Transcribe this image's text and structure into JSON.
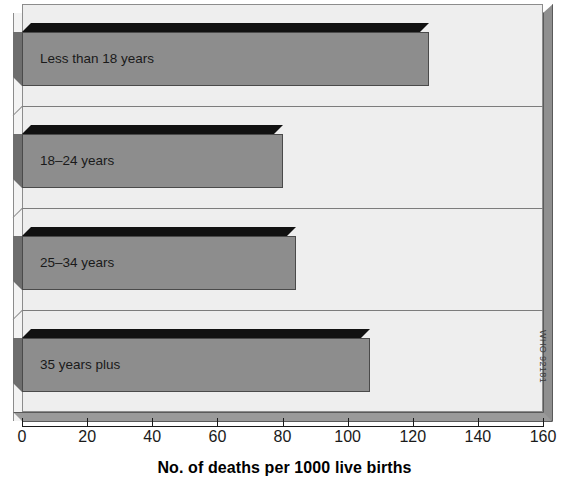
{
  "chart_data": {
    "type": "bar",
    "orientation": "horizontal",
    "title": "",
    "xlabel": "No. of deaths per 1000 live births",
    "ylabel": "",
    "categories": [
      "Less than 18 years",
      "18–24 years",
      "25–34 years",
      "35 years plus"
    ],
    "values": [
      125,
      80,
      84,
      107
    ],
    "xlim": [
      0,
      160
    ],
    "xticks": [
      0,
      20,
      40,
      60,
      80,
      100,
      120,
      140,
      160
    ],
    "xtick_labels": [
      "0",
      "20",
      "40",
      "60",
      "80",
      "100",
      "120",
      "140",
      "160"
    ],
    "grid": true,
    "legend": null,
    "style": "3d",
    "annotations": [
      "WHO 92181"
    ],
    "colors": {
      "bar_front": "#8d8d8d",
      "bar_top": "#111111",
      "bar_side": "#6e6e6e",
      "plot_background": "#eeeeee",
      "wall": "#8f8f8f",
      "axis": "#1a1a1a",
      "gridline": "#7c7c7c"
    }
  },
  "axis": {
    "title": "No. of deaths per 1000 live births",
    "ticks": [
      {
        "value": 0,
        "label": "0"
      },
      {
        "value": 20,
        "label": "20"
      },
      {
        "value": 40,
        "label": "40"
      },
      {
        "value": 60,
        "label": "60"
      },
      {
        "value": 80,
        "label": "80"
      },
      {
        "value": 100,
        "label": "100"
      },
      {
        "value": 120,
        "label": "120"
      },
      {
        "value": 140,
        "label": "140"
      },
      {
        "value": 160,
        "label": "160"
      }
    ]
  },
  "bars": [
    {
      "label": "Less than 18 years",
      "value": 125
    },
    {
      "label": "18–24 years",
      "value": 80
    },
    {
      "label": "25–34 years",
      "value": 84
    },
    {
      "label": "35 years plus",
      "value": 107
    }
  ],
  "credit": {
    "text": "WHO 92181"
  }
}
